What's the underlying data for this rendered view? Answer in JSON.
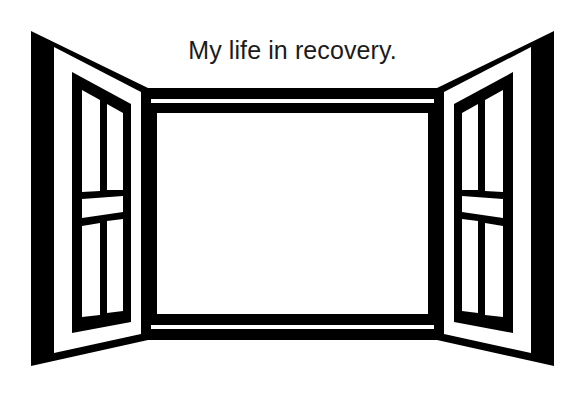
{
  "page": {
    "background_color": "#ffffff",
    "width": 585,
    "height": 399
  },
  "illustration": {
    "name": "open-window-clipart",
    "subject": "open window with two outward-opening casement shutters",
    "style": "black and white line art / clip art silhouette",
    "ink_color": "#000000",
    "paper_color": "#ffffff",
    "glass_color": "#ffffff",
    "parts": {
      "left_shutter_label": "Left shutter",
      "right_shutter_label": "Right shutter",
      "center_opening_label": "Open window view",
      "top_rail_label": "Top rail",
      "sill_label": "Window sill"
    },
    "pane_grid": {
      "columns": 2,
      "rows": 2,
      "per_shutter_panes": 4,
      "mullion": "horizontal"
    }
  },
  "caption": {
    "text": "My life in recovery.",
    "color": "#1b1b1b",
    "align": "center"
  }
}
